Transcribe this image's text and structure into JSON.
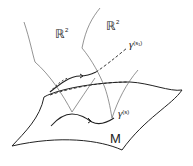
{
  "diagram": {
    "labels": {
      "plane_left": {
        "base": "ℝ",
        "sup": "2"
      },
      "plane_right": {
        "base": "ℝ",
        "sup": "2"
      },
      "gamma_upper": {
        "symbol": "γ",
        "arg": "(s₁)"
      },
      "gamma_lower": {
        "symbol": "γ",
        "arg": "(s)"
      },
      "manifold": "M"
    },
    "colors": {
      "stroke": "#222222",
      "thin_stroke": "#555555",
      "background": "#ffffff"
    }
  }
}
